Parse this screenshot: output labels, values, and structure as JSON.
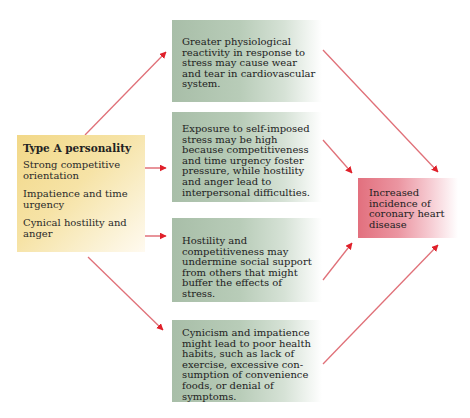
{
  "source_box": {
    "title": "Type A personality",
    "items": [
      "Strong competitive orientation",
      "Impatience and time urgency",
      "Cynical hostility and anger"
    ],
    "color": "#f2d888"
  },
  "mechanisms": [
    {
      "text": "Greater physiological reactivity in response to stress may cause wear and tear in cardiovascular system."
    },
    {
      "text": "Exposure to self-imposed stress may be high because competitiveness and time urgency foster pressure, while hostility and anger lead to interpersonal difficulties."
    },
    {
      "text": "Hostility and competitiveness may undermine social support from others that might buffer the effects of stress."
    },
    {
      "text": "Cynicism and impatience might lead to poor health habits, such as lack of exercise, excessive con-sumption of convenience foods, or denial of symptoms."
    }
  ],
  "outcome_box": {
    "text": "Increased incidence of coronary heart disease",
    "color": "#e2707e"
  },
  "colors": {
    "arrow": "#e0202a",
    "mechanism_box": "#a8bea8"
  }
}
